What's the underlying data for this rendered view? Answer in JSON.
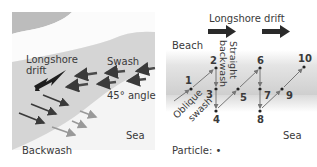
{
  "left_panel": {
    "labels": {
      "longshore_line1": "Longshore",
      "longshore_line2": "drift",
      "swash": "Swash",
      "angle": "45° angle",
      "sea": "Sea",
      "backwash": "Backwash"
    },
    "colors": {
      "beach_top": "#b8b8b8",
      "beach_band": "#d4d4d4",
      "sea": "#f3f3f3",
      "arrow_dark": "#3a3a3a",
      "arrow_mid": "#555555",
      "arrow_light": "#9a9a9a",
      "drift_arrow": "#1e1e1e"
    }
  },
  "right_panel": {
    "title": "Longshore drift",
    "labels": {
      "beach": "Beach",
      "straight_line1": "Straight",
      "straight_line2": "backwash",
      "oblique_line1": "Oblique",
      "oblique_line2": "swash",
      "sea": "Sea",
      "particle": "Particle: •"
    },
    "points": [
      {
        "id": "1",
        "x": 191,
        "y": 89,
        "lx": 185,
        "ly": 84
      },
      {
        "id": "2",
        "x": 216,
        "y": 68,
        "lx": 210,
        "ly": 64
      },
      {
        "id": "3",
        "x": 216,
        "y": 89,
        "lx": 206,
        "ly": 98
      },
      {
        "id": "4",
        "x": 216,
        "y": 111,
        "lx": 213,
        "ly": 123
      },
      {
        "id": "5",
        "x": 238,
        "y": 89,
        "lx": 240,
        "ly": 101
      },
      {
        "id": "6",
        "x": 260,
        "y": 68,
        "lx": 257,
        "ly": 64
      },
      {
        "id": "7",
        "x": 260,
        "y": 89,
        "lx": 264,
        "ly": 99
      },
      {
        "id": "8",
        "x": 260,
        "y": 111,
        "lx": 257,
        "ly": 123
      },
      {
        "id": "9",
        "x": 282,
        "y": 89,
        "lx": 286,
        "ly": 99
      },
      {
        "id": "10",
        "x": 304,
        "y": 67,
        "lx": 298,
        "ly": 62
      }
    ],
    "colors": {
      "band": "#d0d0d0",
      "band_light": "#eeeeee",
      "arrow": "#7a7a7a",
      "drift_arrow": "#2a2a2a"
    }
  }
}
